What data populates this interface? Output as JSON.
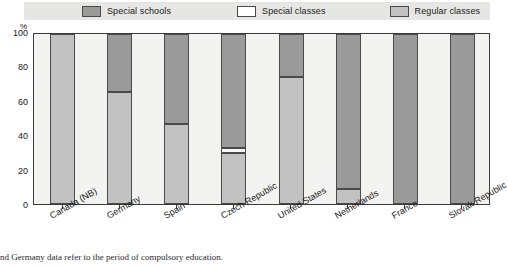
{
  "chart_data": {
    "type": "bar",
    "subtype": "stacked-vertical-100",
    "title": "",
    "xlabel": "",
    "ylabel": "%",
    "ylim": [
      0,
      100
    ],
    "yticks": [
      0,
      20,
      40,
      60,
      80,
      100
    ],
    "ytick_labels": [
      "0",
      "20",
      "40",
      "60",
      "80",
      "100"
    ],
    "grid": false,
    "legend_position": "top",
    "categories": [
      "Canada (NB)",
      "Germany",
      "Spain",
      "Czech Republic",
      "United States",
      "Netherlands",
      "France",
      "Slovak Republic"
    ],
    "series": [
      {
        "name": "Special schools",
        "color": "#9a9a9a",
        "values": [
          0,
          34,
          53,
          67,
          25,
          91,
          100,
          100
        ]
      },
      {
        "name": "Special classes",
        "color": "#ffffff",
        "values": [
          0,
          0,
          0,
          3,
          0,
          0,
          0,
          0
        ]
      },
      {
        "name": "Regular classes",
        "color": "#c2c2c2",
        "values": [
          100,
          66,
          47,
          30,
          75,
          9,
          0,
          0
        ]
      }
    ],
    "annotations": []
  },
  "legend": {
    "items": [
      {
        "label": "Special schools",
        "swatch": "special-schools"
      },
      {
        "label": "Special classes",
        "swatch": "special-classes"
      },
      {
        "label": "Regular classes",
        "swatch": "regular-classes"
      }
    ]
  },
  "axis": {
    "y_unit": "%"
  },
  "footnote": {
    "text": "nd Germany data refer to the period of compulsory education."
  }
}
